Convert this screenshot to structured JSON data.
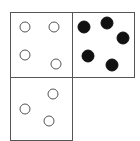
{
  "diagram": {
    "stroke_color": "#555555",
    "fill_color": "#111111",
    "boxes": [
      {
        "name": "top-left",
        "x": 10,
        "y": 12,
        "w": 62,
        "h": 65,
        "circles": [
          {
            "cx": 25,
            "cy": 27,
            "r": 5,
            "filled": false
          },
          {
            "cx": 54,
            "cy": 27,
            "r": 5,
            "filled": false
          },
          {
            "cx": 25,
            "cy": 55,
            "r": 5,
            "filled": false
          },
          {
            "cx": 56,
            "cy": 64,
            "r": 5,
            "filled": false
          }
        ]
      },
      {
        "name": "top-right",
        "x": 72,
        "y": 12,
        "w": 62,
        "h": 65,
        "circles": [
          {
            "cx": 84,
            "cy": 27,
            "r": 6,
            "filled": true
          },
          {
            "cx": 107,
            "cy": 23,
            "r": 6,
            "filled": true
          },
          {
            "cx": 123,
            "cy": 38,
            "r": 6,
            "filled": true
          },
          {
            "cx": 88,
            "cy": 56,
            "r": 6,
            "filled": true
          },
          {
            "cx": 112,
            "cy": 65,
            "r": 6,
            "filled": true
          }
        ]
      },
      {
        "name": "bottom-left",
        "x": 10,
        "y": 77,
        "w": 62,
        "h": 63,
        "circles": [
          {
            "cx": 53,
            "cy": 94,
            "r": 5,
            "filled": false
          },
          {
            "cx": 25,
            "cy": 109,
            "r": 5,
            "filled": false
          },
          {
            "cx": 49,
            "cy": 121,
            "r": 5,
            "filled": false
          }
        ]
      }
    ]
  }
}
